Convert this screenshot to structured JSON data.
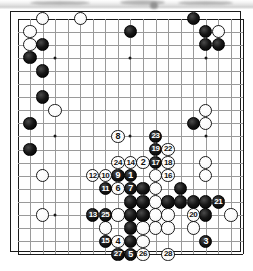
{
  "diagram": {
    "type": "go-board",
    "board_size": 19,
    "colors": {
      "black_stone": "#000000",
      "white_stone": "#ffffff",
      "grid_line": "#9a9a9a",
      "board_border": "#1a1a1a",
      "board_background": "#ffffff",
      "black_number_text": "#ffffff",
      "white_number_text": "#111111"
    },
    "geometry": {
      "left": 10,
      "top": 11,
      "width": 231,
      "height": 241,
      "cell_w": 12.55,
      "cell_h": 13.1,
      "origin_x": 6.5,
      "origin_y": 6.5,
      "stone_diameter": 13.4,
      "star_points": [
        [
          3,
          3
        ],
        [
          9,
          3
        ],
        [
          15,
          3
        ],
        [
          3,
          9
        ],
        [
          9,
          9
        ],
        [
          15,
          9
        ],
        [
          3,
          15
        ],
        [
          9,
          15
        ],
        [
          15,
          15
        ]
      ]
    },
    "plain_stones": [
      {
        "c": 3,
        "r": 1,
        "color": "white"
      },
      {
        "c": 6,
        "r": 1,
        "color": "white"
      },
      {
        "c": 2,
        "r": 2,
        "color": "white"
      },
      {
        "c": 2,
        "r": 3,
        "color": "white"
      },
      {
        "c": 3,
        "r": 3,
        "color": "black"
      },
      {
        "c": 10,
        "r": 2,
        "color": "black"
      },
      {
        "c": 15,
        "r": 1,
        "color": "black"
      },
      {
        "c": 16,
        "r": 2,
        "color": "black"
      },
      {
        "c": 17,
        "r": 2,
        "color": "white"
      },
      {
        "c": 16,
        "r": 3,
        "color": "black"
      },
      {
        "c": 17,
        "r": 3,
        "color": "black"
      },
      {
        "c": 2,
        "r": 4,
        "color": "black"
      },
      {
        "c": 3,
        "r": 5,
        "color": "black"
      },
      {
        "c": 3,
        "r": 7,
        "color": "black"
      },
      {
        "c": 4,
        "r": 8,
        "color": "white"
      },
      {
        "c": 2,
        "r": 9,
        "color": "black"
      },
      {
        "c": 2,
        "r": 11,
        "color": "black"
      },
      {
        "c": 16,
        "r": 8,
        "color": "white"
      },
      {
        "c": 16,
        "r": 9,
        "color": "white"
      },
      {
        "c": 15,
        "r": 9,
        "color": "black"
      },
      {
        "c": 3,
        "r": 13,
        "color": "white"
      },
      {
        "c": 3,
        "r": 16,
        "color": "white"
      },
      {
        "c": 16,
        "r": 12,
        "color": "white"
      },
      {
        "c": 16,
        "r": 13,
        "color": "white"
      },
      {
        "c": 11,
        "r": 14,
        "color": "black"
      },
      {
        "c": 10,
        "r": 15,
        "color": "black"
      },
      {
        "c": 11,
        "r": 15,
        "color": "black"
      },
      {
        "c": 12,
        "r": 15,
        "color": "white"
      },
      {
        "c": 13,
        "r": 15,
        "color": "black"
      },
      {
        "c": 14,
        "r": 15,
        "color": "black"
      },
      {
        "c": 9,
        "r": 16,
        "color": "white"
      },
      {
        "c": 10,
        "r": 16,
        "color": "black"
      },
      {
        "c": 11,
        "r": 16,
        "color": "black"
      },
      {
        "c": 12,
        "r": 16,
        "color": "white"
      },
      {
        "c": 13,
        "r": 16,
        "color": "white"
      },
      {
        "c": 16,
        "r": 16,
        "color": "black"
      },
      {
        "c": 15,
        "r": 15,
        "color": "black"
      },
      {
        "c": 16,
        "r": 15,
        "color": "black"
      },
      {
        "c": 8,
        "r": 17,
        "color": "white"
      },
      {
        "c": 10,
        "r": 17,
        "color": "black"
      },
      {
        "c": 11,
        "r": 17,
        "color": "white"
      },
      {
        "c": 12,
        "r": 17,
        "color": "white"
      },
      {
        "c": 13,
        "r": 17,
        "color": "white"
      },
      {
        "c": 15,
        "r": 17,
        "color": "white"
      },
      {
        "c": 18,
        "r": 16,
        "color": "white"
      },
      {
        "c": 10,
        "r": 18,
        "color": "black"
      },
      {
        "c": 11,
        "r": 18,
        "color": "white"
      },
      {
        "c": 12,
        "r": 14,
        "color": "white"
      },
      {
        "c": 14,
        "r": 14,
        "color": "black"
      },
      {
        "c": 12,
        "r": 13,
        "color": "white"
      }
    ],
    "moves": [
      {
        "n": 1,
        "c": 10,
        "r": 13,
        "color": "black"
      },
      {
        "n": 2,
        "c": 11,
        "r": 12,
        "color": "white"
      },
      {
        "n": 3,
        "c": 16,
        "r": 18,
        "color": "black"
      },
      {
        "n": 4,
        "c": 9,
        "r": 18,
        "color": "white"
      },
      {
        "n": 5,
        "c": 10,
        "r": 19,
        "color": "black"
      },
      {
        "n": 6,
        "c": 9,
        "r": 14,
        "color": "white"
      },
      {
        "n": 7,
        "c": 10,
        "r": 14,
        "color": "black"
      },
      {
        "n": 8,
        "c": 9,
        "r": 10,
        "color": "white"
      },
      {
        "n": 9,
        "c": 9,
        "r": 13,
        "color": "black"
      },
      {
        "n": 10,
        "c": 8,
        "r": 13,
        "color": "white"
      },
      {
        "n": 11,
        "c": 8,
        "r": 14,
        "color": "black"
      },
      {
        "n": 12,
        "c": 7,
        "r": 13,
        "color": "white"
      },
      {
        "n": 13,
        "c": 7,
        "r": 16,
        "color": "black"
      },
      {
        "n": 14,
        "c": 10,
        "r": 12,
        "color": "white"
      },
      {
        "n": 15,
        "c": 8,
        "r": 18,
        "color": "black"
      },
      {
        "n": 16,
        "c": 13,
        "r": 13,
        "color": "white"
      },
      {
        "n": 17,
        "c": 12,
        "r": 12,
        "color": "black"
      },
      {
        "n": 18,
        "c": 13,
        "r": 12,
        "color": "white"
      },
      {
        "n": 19,
        "c": 12,
        "r": 11,
        "color": "black"
      },
      {
        "n": 20,
        "c": 15,
        "r": 16,
        "color": "white"
      },
      {
        "n": 21,
        "c": 17,
        "r": 15,
        "color": "black"
      },
      {
        "n": 22,
        "c": 13,
        "r": 11,
        "color": "white"
      },
      {
        "n": 23,
        "c": 12,
        "r": 10,
        "color": "black"
      },
      {
        "n": 24,
        "c": 9,
        "r": 12,
        "color": "white"
      },
      {
        "n": 25,
        "c": 8,
        "r": 16,
        "color": "black"
      },
      {
        "n": 26,
        "c": 11,
        "r": 19,
        "color": "white"
      },
      {
        "n": 27,
        "c": 9,
        "r": 19,
        "color": "black"
      },
      {
        "n": 28,
        "c": 13,
        "r": 19,
        "color": "white"
      }
    ]
  }
}
